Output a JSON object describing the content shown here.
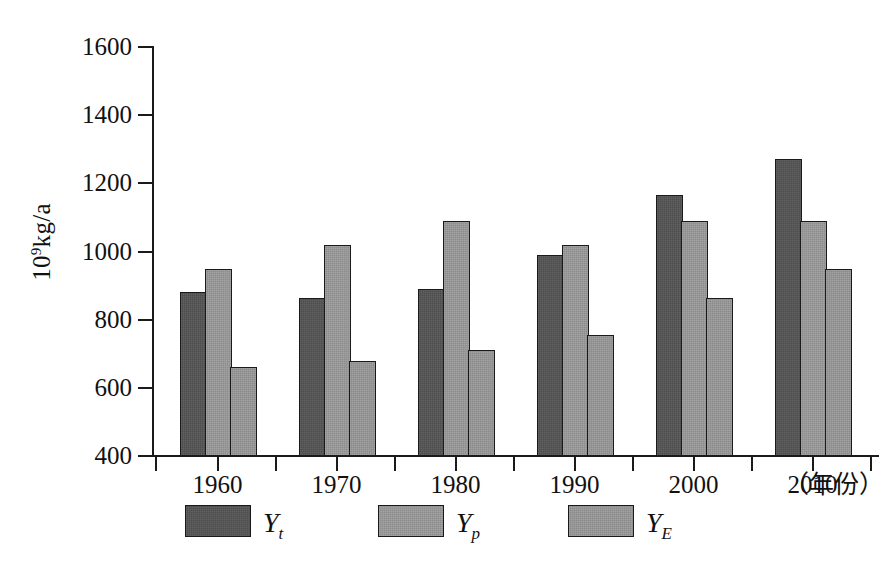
{
  "chart_data": {
    "type": "bar",
    "title": "",
    "subtitle": "",
    "xlabel": "（年份）",
    "ylabel": "10⁹kg/a",
    "ylabel_base": "10",
    "ylabel_exponent": "9",
    "ylabel_suffix": "kg/a",
    "categories": [
      "1960",
      "1970",
      "1980",
      "1990",
      "2000",
      "2010"
    ],
    "ylim": [
      400,
      1600
    ],
    "yticks": [
      400,
      600,
      800,
      1000,
      1200,
      1400,
      1600
    ],
    "ytick_labels": [
      "400",
      "600",
      "800",
      "1000",
      "1200",
      "1400",
      "1600"
    ],
    "grid": false,
    "legend_position": "bottom",
    "series": [
      {
        "name": "Y_t",
        "label_base": "Y",
        "label_sub": "t",
        "color": "#4d4d4d",
        "values": [
          880,
          865,
          890,
          990,
          1165,
          1270
        ]
      },
      {
        "name": "Y_p",
        "label_base": "Y",
        "label_sub": "p",
        "color": "#8c8c8c",
        "values": [
          950,
          1020,
          1090,
          1020,
          1090,
          1090
        ]
      },
      {
        "name": "Y_E",
        "label_base": "Y",
        "label_sub": "E",
        "color": "#8a8a8a",
        "values": [
          660,
          680,
          710,
          755,
          865,
          950
        ]
      }
    ]
  },
  "axes": {
    "axis_color": "#1a1a1a"
  }
}
